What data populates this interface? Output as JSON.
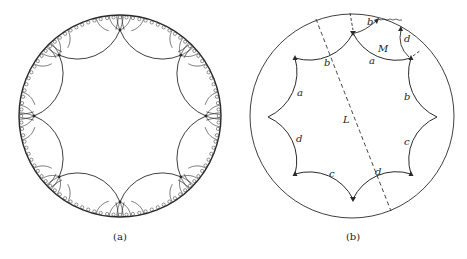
{
  "figure": {
    "panels": [
      {
        "id": "a",
        "caption": "(a)",
        "description": "Regular octagonal tiling of the hyperbolic disk (8 octagons meeting at each vertex)",
        "polygon_sides": 8,
        "polygons_per_vertex": 8
      },
      {
        "id": "b",
        "caption": "(b)",
        "description": "Fundamental octagon with side pairings and geodesic loops",
        "side_labels": {
          "top_left": "b",
          "top_right": "a",
          "upper_left": "a",
          "upper_right": "b",
          "lower_left": "d",
          "lower_right": "c",
          "bottom_left": "c",
          "bottom_right": "d"
        },
        "curve_labels": {
          "dashed_line": "L",
          "loop": "M"
        },
        "outer_labels": {
          "top_small_b": "b",
          "top_small_d": "d"
        }
      }
    ]
  },
  "colors": {
    "stroke": "#2a2a2a",
    "background": "#ffffff"
  }
}
